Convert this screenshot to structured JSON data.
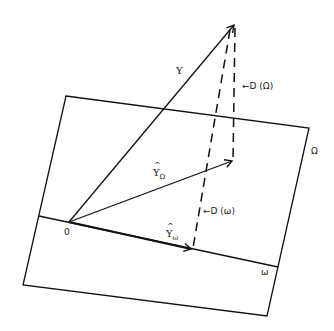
{
  "diagram": {
    "type": "vector-projection",
    "colors": {
      "stroke": "#111111",
      "background": "#ffffff"
    },
    "planes": {
      "omega_big": {
        "label": "Ω",
        "corners": [
          [
            66,
            96
          ],
          [
            309,
            128
          ],
          [
            267,
            316
          ],
          [
            23,
            285
          ]
        ]
      },
      "omega_small": {
        "label": "ω",
        "line": [
          [
            39,
            216
          ],
          [
            278,
            267
          ]
        ]
      }
    },
    "points": {
      "origin": {
        "label": "0",
        "xy": [
          69,
          222
        ]
      },
      "y_tip": [
        235,
        23
      ],
      "y_hat_Omega_tip": [
        233,
        161
      ],
      "y_hat_omega_tip": [
        193,
        250
      ]
    },
    "vectors": [
      {
        "name": "Y",
        "label": "Y"
      },
      {
        "name": "Y_hat_Omega",
        "label": "Y",
        "subscript": "Ω"
      },
      {
        "name": "Y_hat_omega",
        "label": "Y",
        "subscript": "ω"
      }
    ],
    "distances": [
      {
        "name": "D_Omega",
        "label": "←D (Ω)"
      },
      {
        "name": "D_omega",
        "label": "←D (ω)"
      }
    ]
  }
}
